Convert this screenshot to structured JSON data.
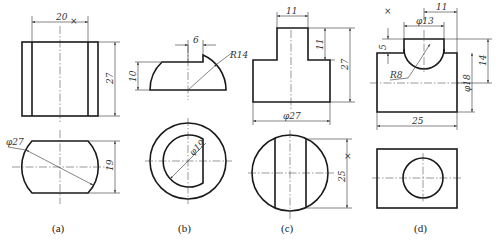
{
  "figure": {
    "panels": [
      {
        "caption": "(a)",
        "dims": {
          "width": "20",
          "height": "27",
          "diameter": "φ27",
          "top_height": "19"
        },
        "marks": {
          "x_mark": "×"
        }
      },
      {
        "caption": "(b)",
        "dims": {
          "step": "6",
          "radius": "R14",
          "height": "10",
          "diameter": "φ19"
        }
      },
      {
        "caption": "(c)",
        "dims": {
          "top_width": "11",
          "top_height": "11",
          "height": "27",
          "diameter": "φ27",
          "top_dim": "25"
        },
        "marks": {
          "x_mark": "×"
        }
      },
      {
        "caption": "(d)",
        "dims": {
          "offset": "11",
          "boss_diameter": "φ13",
          "boss_height": "5",
          "radius": "R8",
          "height": "14",
          "diameter": "φ18",
          "width": "25"
        },
        "marks": {
          "x_mark": "×"
        }
      }
    ]
  }
}
